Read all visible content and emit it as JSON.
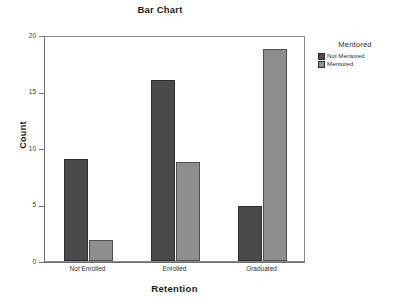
{
  "chart_data": {
    "type": "bar",
    "title": "Bar Chart",
    "xlabel": "Retention",
    "ylabel": "Count",
    "categories": [
      "Not Enrolled",
      "Enrolled",
      "Graduated"
    ],
    "series": [
      {
        "name": "Not Mentored",
        "values": [
          9,
          16,
          4.9
        ],
        "color": "#4a4a4a"
      },
      {
        "name": "Mentored",
        "values": [
          1.9,
          8.8,
          18.8
        ],
        "color": "#8e8e8e"
      }
    ],
    "ylim": [
      0,
      20
    ],
    "yticks": [
      0,
      5,
      10,
      15,
      20
    ],
    "ytick_labels": [
      "0",
      "5",
      "10",
      "15",
      "20"
    ],
    "grid": false,
    "legend": {
      "title": "Mentored",
      "position": "right",
      "entries": [
        "Not Mentored",
        "Mentored"
      ]
    }
  }
}
